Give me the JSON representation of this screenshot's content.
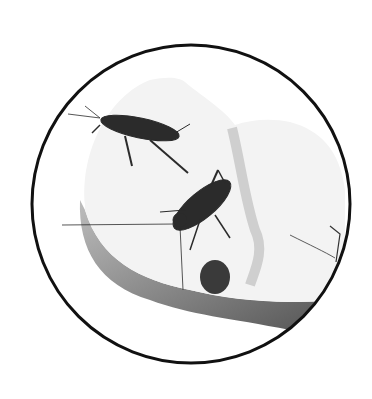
{
  "image": {
    "description": "Black and white photograph of two crickets on an apple slice, framed inside a thin black circle",
    "subjects": [
      "cricket",
      "cricket",
      "apple slice"
    ],
    "frame": {
      "shape": "circle",
      "stroke_color": "#111111",
      "background": "#ffffff"
    },
    "colors": {
      "apple_flesh": "#f4f4f4",
      "apple_skin": "#6e6e6e",
      "core": "#3a3a3a",
      "cricket": "#2a2a2a"
    }
  }
}
